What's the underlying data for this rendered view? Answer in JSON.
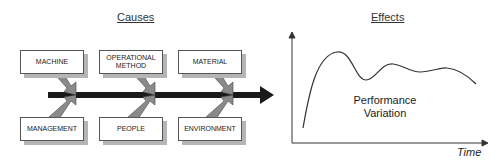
{
  "causes": {
    "title": "Causes",
    "top": [
      {
        "label": "MACHINE"
      },
      {
        "label": "OPERATIONAL METHOD"
      },
      {
        "label": "MATERIAL"
      }
    ],
    "bottom": [
      {
        "label": "MANAGEMENT"
      },
      {
        "label": "PEOPLE"
      },
      {
        "label": "ENVIRONMENT"
      }
    ]
  },
  "effects": {
    "title": "Effects",
    "curve_label_line1": "Performance",
    "curve_label_line2": "Variation",
    "x_axis_label": "Time"
  },
  "colors": {
    "spine": "#1a1a1a",
    "branch_fill": "#8a8a8a",
    "box_shadow": "#b5b5b5"
  }
}
